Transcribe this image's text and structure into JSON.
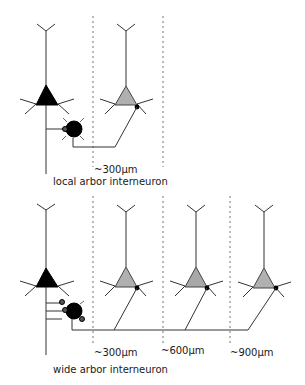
{
  "colors": {
    "pyramidal_source": "#000000",
    "pyramidal_target": "#b0b0b0",
    "interneuron": "#000000",
    "line": "#333333",
    "dashed": "#777777"
  },
  "top_panel": {
    "distance_label": "~300µm",
    "caption": "local arbor interneuron"
  },
  "bottom_panel": {
    "distance_labels": [
      "~300µm",
      "~600µm",
      "~900µm"
    ],
    "caption": "wide arbor interneuron"
  }
}
